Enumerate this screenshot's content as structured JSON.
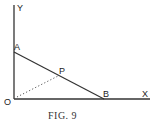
{
  "figure": {
    "caption": "Fig. 9",
    "caption_display": "FIG. 9",
    "colors": {
      "line": "#333333",
      "background": "#ffffff"
    },
    "axes": {
      "x_label": "X",
      "y_label": "Y",
      "origin_label": "O"
    },
    "points": [
      {
        "name": "A",
        "label": "A"
      },
      {
        "name": "B",
        "label": "B"
      },
      {
        "name": "P",
        "label": "P"
      },
      {
        "name": "O",
        "label": "O"
      }
    ],
    "segments": [
      {
        "from": "A",
        "to": "B",
        "style": "solid"
      },
      {
        "from": "O",
        "to": "P",
        "style": "dotted"
      }
    ]
  }
}
